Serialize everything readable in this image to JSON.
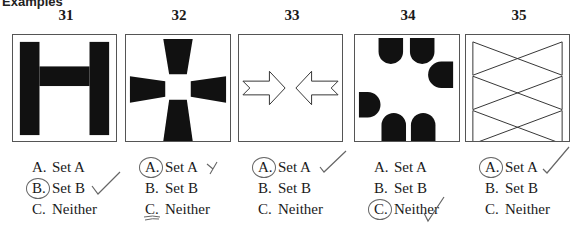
{
  "section_header_fragment": "Examples",
  "questions": [
    {
      "number": "31",
      "figure": "h-shape",
      "options": [
        {
          "letter": "A.",
          "label": "Set A"
        },
        {
          "letter": "B.",
          "label": "Set B"
        },
        {
          "letter": "C.",
          "label": "Neither"
        }
      ],
      "circled": "B",
      "checkmark": "B"
    },
    {
      "number": "32",
      "figure": "four-trapezoids-cross",
      "options": [
        {
          "letter": "A.",
          "label": "Set A"
        },
        {
          "letter": "B.",
          "label": "Set B"
        },
        {
          "letter": "C.",
          "label": "Neither"
        }
      ],
      "circled": "A",
      "x_mark": "A",
      "underlined": "C"
    },
    {
      "number": "33",
      "figure": "two-arrows-pointing-inward",
      "options": [
        {
          "letter": "A.",
          "label": "Set A"
        },
        {
          "letter": "B.",
          "label": "Set B"
        },
        {
          "letter": "C.",
          "label": "Neither"
        }
      ],
      "circled": "A",
      "checkmark": "A"
    },
    {
      "number": "34",
      "figure": "six-half-rounded-shapes",
      "options": [
        {
          "letter": "A.",
          "label": "Set A"
        },
        {
          "letter": "B.",
          "label": "Set B"
        },
        {
          "letter": "C.",
          "label": "Neither"
        }
      ],
      "circled": "C",
      "checkmark": "C"
    },
    {
      "number": "35",
      "figure": "three-stacked-bowties",
      "options": [
        {
          "letter": "A.",
          "label": "Set A"
        },
        {
          "letter": "B.",
          "label": "Set B"
        },
        {
          "letter": "C.",
          "label": "Neither"
        }
      ],
      "circled": "A",
      "checkmark": "A"
    }
  ],
  "colors": {
    "ink": "#1a1a1a",
    "pencil": "#555555",
    "border": "#555555"
  }
}
